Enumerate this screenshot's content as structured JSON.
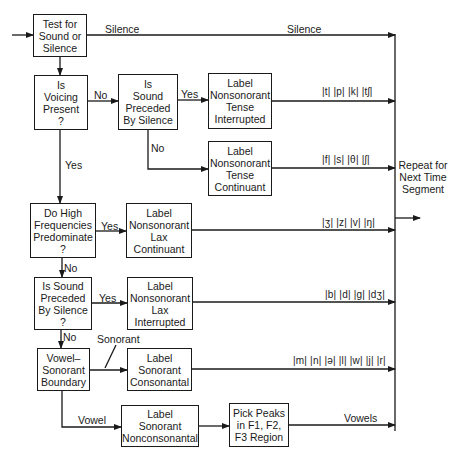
{
  "boxes": {
    "test": [
      "Test for",
      "Sound or",
      "Silence"
    ],
    "voicing": [
      "Is",
      "Voicing",
      "Present",
      "?"
    ],
    "preceded1": [
      "Is",
      "Sound",
      "Preceded",
      "By Silence"
    ],
    "nt_interrupted": [
      "Label",
      "Nonsonorant",
      "Tense",
      "Interrupted"
    ],
    "nt_continuant": [
      "Label",
      "Nonsonorant",
      "Tense",
      "Continuant"
    ],
    "high_freq": [
      "Do High",
      "Frequencies",
      "Predominate",
      "?"
    ],
    "nl_continuant": [
      "Label",
      "Nonsonorant",
      "Lax",
      "Continuant"
    ],
    "preceded2": [
      "Is Sound",
      "Preceded",
      "By Silence",
      "?"
    ],
    "nl_interrupted": [
      "Label",
      "Nonsonorant",
      "Lax",
      "Interrupted"
    ],
    "vowel_sonorant": [
      "Vowel–",
      "Sonorant",
      "Boundary"
    ],
    "sonorant_consonantal": [
      "Label",
      "Sonorant",
      "Consonantal"
    ],
    "sonorant_nonconsonantal": [
      "Label",
      "Sonorant",
      "Nonconsonantal"
    ],
    "pick_peaks": [
      "Pick Peaks",
      "in F1, F2,",
      "F3 Region"
    ],
    "repeat": [
      "Repeat for",
      "Next Time",
      "Segment"
    ]
  },
  "edge_labels": {
    "silence_left": "Silence",
    "silence_right": "Silence",
    "voicing_no": "No",
    "voicing_yes": "Yes",
    "preceded1_yes": "Yes",
    "preceded1_no": "No",
    "high_freq_yes": "Yes",
    "high_freq_no": "No",
    "preceded2_yes": "Yes",
    "preceded2_no": "No",
    "sonorant": "Sonorant",
    "vowel": "Vowel",
    "vowels": "Vowels"
  },
  "phonemes": {
    "nt_interrupted": "|t| |p| |k| |tʃ|",
    "nt_continuant": "|f| |s| |θ| |ʃ|",
    "nl_continuant": "|ʒ| |z| |v| |ŋ|",
    "nl_interrupted": "|b| |d| |g| |dʒ|",
    "sonorant_consonantal": "|m| |n| |ə| |l| |w| |j| |r|"
  }
}
